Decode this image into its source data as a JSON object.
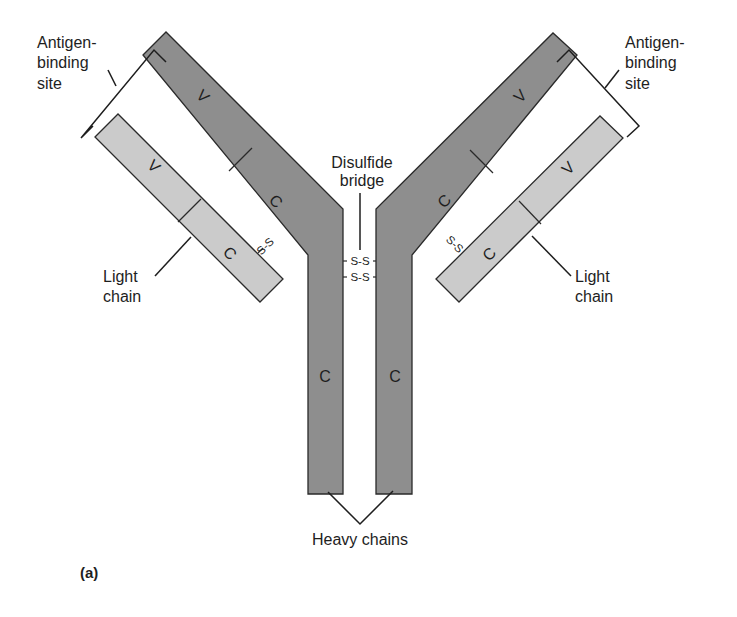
{
  "figure": {
    "panel_label": "(a)",
    "colors": {
      "heavy_chain": "#8e8e8e",
      "light_chain": "#cbcbcb",
      "outline": "#2a2a2a",
      "text": "#1e1e1e"
    }
  },
  "labels": {
    "antigen_binding_left": [
      "Antigen-",
      "binding",
      "site"
    ],
    "antigen_binding_right": [
      "Antigen-",
      "binding",
      "site"
    ],
    "disulfide_bridge": [
      "Disulfide",
      "bridge"
    ],
    "light_chain_left": [
      "Light",
      "chain"
    ],
    "light_chain_right": [
      "Light",
      "chain"
    ],
    "heavy_chains": "Heavy chains"
  },
  "regions": {
    "left_heavy_variable": "V",
    "left_heavy_constant_arm": "C",
    "left_heavy_constant_stem": "C",
    "left_light_variable": "V",
    "left_light_constant": "C",
    "right_heavy_variable": "V",
    "right_heavy_constant_arm": "C",
    "right_heavy_constant_stem": "C",
    "right_light_variable": "V",
    "right_light_constant": "C"
  },
  "bonds": {
    "left_light_heavy": "S-S",
    "right_light_heavy": "S-S",
    "hinge_top": "S-S",
    "hinge_bottom": "S-S"
  }
}
